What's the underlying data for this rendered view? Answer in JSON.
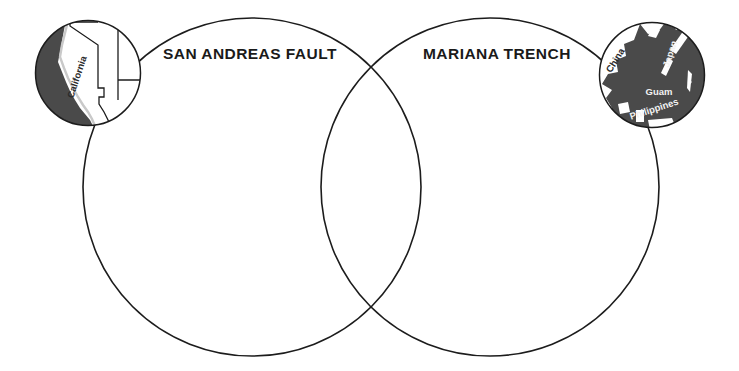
{
  "document": {
    "type": "venn-diagram-worksheet",
    "title": "",
    "background_color": "#ffffff",
    "outline_color": "#1c1c1c",
    "ocean_fill_color": "#4a4a4a",
    "land_fill_color": "#ffffff"
  },
  "venn": {
    "left_circle": {
      "label": "SAN ANDREAS FAULT",
      "cx": 252,
      "cy": 187,
      "r": 169
    },
    "right_circle": {
      "label": "MARIANA TRENCH",
      "cx": 490,
      "cy": 187,
      "r": 169
    },
    "overlap_label": ""
  },
  "insets": {
    "left": {
      "name": "california-inset-map",
      "cx": 88,
      "cy": 73,
      "r": 53,
      "labels": [
        {
          "text": "California",
          "rotation": -72
        }
      ]
    },
    "right": {
      "name": "western-pacific-inset-map",
      "cx": 652,
      "cy": 75,
      "r": 53,
      "labels": [
        {
          "text": "China",
          "rotation": -58
        },
        {
          "text": "Japan",
          "rotation": -72
        },
        {
          "text": "Guam",
          "rotation": 0
        },
        {
          "text": "Philippines",
          "rotation": -18
        }
      ]
    }
  }
}
